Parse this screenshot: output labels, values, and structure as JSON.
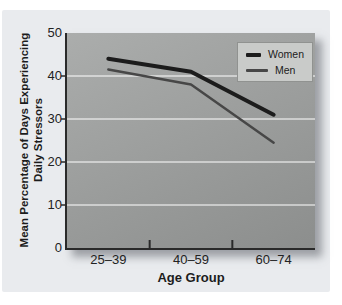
{
  "figure": {
    "card_background": "#e9ebee"
  },
  "chart_data": {
    "type": "line",
    "title": "",
    "xlabel": "Age Group",
    "ylabel": "Mean Percentage of Days Experiencing\nDaily Stressors",
    "categories": [
      "25–39",
      "40–59",
      "60–74"
    ],
    "series": [
      {
        "name": "Women",
        "values": [
          44,
          41,
          31
        ],
        "color": "#1c1c1c",
        "width": 4
      },
      {
        "name": "Men",
        "values": [
          41.5,
          38,
          24.5
        ],
        "color": "#474747",
        "width": 2.5
      }
    ],
    "ylim": [
      0,
      50
    ],
    "yticks": [
      0,
      10,
      20,
      30,
      40,
      50
    ],
    "gridlines": [
      10,
      20,
      30,
      40
    ],
    "gridline_color": "#ffffff",
    "axis_color": "#2a2a2a",
    "plot_bg_top": "#abadac",
    "plot_bg_bottom": "#8c8e8d",
    "legend": {
      "position": "top-right",
      "background": "#c9cbc9",
      "border": "#909290"
    }
  }
}
